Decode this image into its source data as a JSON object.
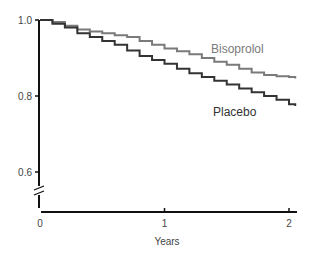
{
  "chart_data": {
    "type": "line",
    "title": "",
    "xlabel": "Years",
    "ylabel": "",
    "xlim": [
      0,
      2.05
    ],
    "ylim": [
      0.6,
      1.0
    ],
    "y_axis_break": true,
    "grid": false,
    "legend_position": "inline labels",
    "x_ticks": [
      "0",
      "1",
      "2"
    ],
    "y_ticks": [
      "0.6",
      "0.8",
      "1.0"
    ],
    "series": [
      {
        "name": "Bisoprolol",
        "color": "#7a7a7a",
        "step": true,
        "x": [
          0,
          0.1,
          0.2,
          0.3,
          0.4,
          0.5,
          0.6,
          0.7,
          0.8,
          0.9,
          1.0,
          1.1,
          1.2,
          1.3,
          1.4,
          1.5,
          1.6,
          1.7,
          1.8,
          1.9,
          2.0,
          2.05
        ],
        "values": [
          1.0,
          0.995,
          0.985,
          0.975,
          0.97,
          0.965,
          0.96,
          0.955,
          0.945,
          0.935,
          0.925,
          0.918,
          0.91,
          0.9,
          0.89,
          0.882,
          0.872,
          0.862,
          0.855,
          0.852,
          0.85,
          0.846
        ]
      },
      {
        "name": "Placebo",
        "color": "#333333",
        "step": true,
        "x": [
          0,
          0.1,
          0.2,
          0.3,
          0.4,
          0.5,
          0.6,
          0.7,
          0.8,
          0.9,
          1.0,
          1.1,
          1.2,
          1.3,
          1.4,
          1.5,
          1.6,
          1.7,
          1.8,
          1.9,
          2.0,
          2.05
        ],
        "values": [
          1.0,
          0.99,
          0.98,
          0.965,
          0.955,
          0.945,
          0.935,
          0.92,
          0.905,
          0.895,
          0.885,
          0.872,
          0.86,
          0.85,
          0.84,
          0.83,
          0.82,
          0.81,
          0.8,
          0.79,
          0.778,
          0.774
        ]
      }
    ]
  }
}
